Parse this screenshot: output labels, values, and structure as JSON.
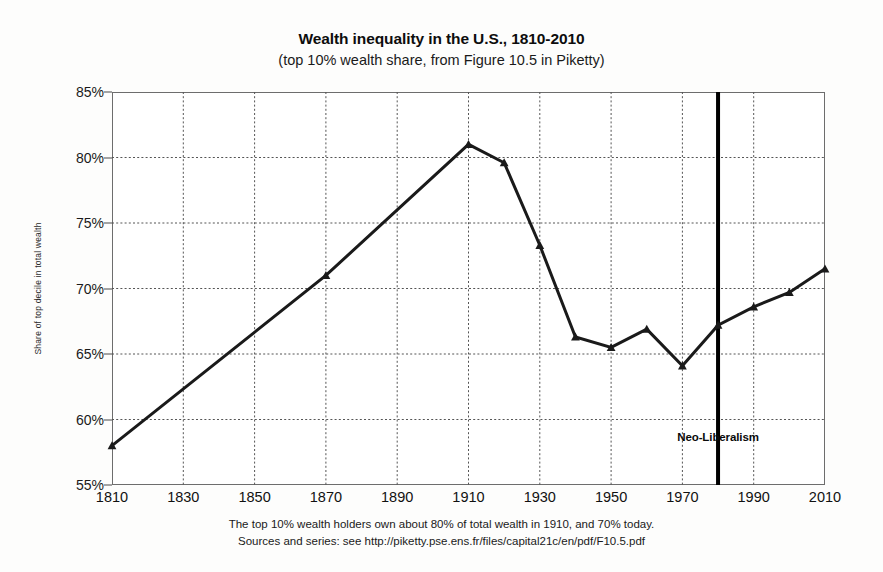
{
  "header": {
    "title": "Wealth inequality in the U.S., 1810-2010",
    "subtitle": "(top 10% wealth share, from Figure 10.5 in Piketty)"
  },
  "footnote": {
    "line1": "The top 10% wealth holders own about 80% of total wealth in 1910, and 70% today.",
    "line2": "Sources and series: see http://piketty.pse.ens.fr/files/capital21c/en/pdf/F10.5.pdf"
  },
  "annotations": {
    "neoliberalism_label": "Neo-Liberalism",
    "neoliberalism_year": 1980
  },
  "colors": {
    "line": "#1a1a1a",
    "grid": "#555555",
    "frame": "#6d6d6d",
    "background": "#ffffff",
    "text": "#111111",
    "vertical_rule": "#000000"
  },
  "chart_data": {
    "type": "line",
    "title": "Wealth inequality in the U.S., 1810-2010",
    "subtitle": "(top 10% wealth share, from Figure 10.5 in Piketty)",
    "xlabel": "",
    "ylabel": "Share of top decile in total wealth",
    "xlim": [
      1810,
      2010
    ],
    "ylim": [
      55,
      85
    ],
    "xticks": [
      1810,
      1830,
      1850,
      1870,
      1890,
      1910,
      1930,
      1950,
      1970,
      1990,
      2010
    ],
    "yticks": [
      55,
      60,
      65,
      70,
      75,
      80,
      85
    ],
    "ytick_labels": [
      "55%",
      "60%",
      "65%",
      "70%",
      "75%",
      "80%",
      "85%"
    ],
    "grid": true,
    "grid_style": "dotted",
    "legend": false,
    "marker": "triangle",
    "series": [
      {
        "name": "Top 10% wealth share",
        "x": [
          1810,
          1870,
          1910,
          1920,
          1930,
          1940,
          1950,
          1960,
          1970,
          1980,
          1990,
          2000,
          2010
        ],
        "values": [
          58.0,
          71.0,
          81.0,
          79.6,
          73.3,
          66.3,
          65.5,
          66.9,
          64.1,
          67.2,
          68.6,
          69.7,
          71.5
        ]
      }
    ],
    "vertical_lines": [
      {
        "x": 1980,
        "label": "Neo-Liberalism",
        "label_y": 58.7,
        "width": 4
      }
    ]
  }
}
